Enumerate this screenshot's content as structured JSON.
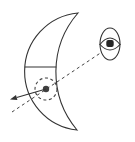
{
  "figure": {
    "elements": {
      "crescent": "crescent-outline",
      "band_line": "chord-line-across-crescent",
      "point": "marked-point-dot",
      "highlight": "dashed-circle-highlight",
      "arrow": "direction-arrow",
      "sight_line": "dashed-line-of-sight",
      "observer": "eye-symbol"
    },
    "colors": {
      "background": "#ffffff",
      "line": "#333333",
      "dashed": "#444444",
      "dot_fill": "#3f3f3f",
      "pupil_fill": "#262626",
      "shape_fill": "#ffffff"
    }
  }
}
